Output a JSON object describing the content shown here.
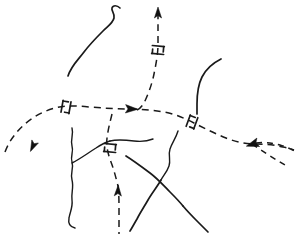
{
  "figure": {
    "background_color": "#ffffff",
    "ink_color": "#1a1a1a",
    "width": 298,
    "height": 249
  },
  "legend_semantics": {
    "dashed_line_meaning": "fault trace (inferred)",
    "solid_line_meaning": "stream / contact line",
    "triangle_arrow_meaning": "relative movement direction",
    "double_tick_meaning": "strike and dip / offset tick pair"
  },
  "features": {
    "solid_curves": [
      {
        "name": "upper-left-wavy-curve",
        "path": "M 68 76 C 71 66 78 60 84 52 C 90 44 96 38 103 31 C 108 26 113 23 114 18 C 115 13 111 11 112 8 C 113 5 117 5 120 8"
      },
      {
        "name": "right-upper-curve",
        "path": "M 221 59 C 213 63 206 69 202 77 C 198 85 197 95 197 104 C 197 110 197 114 197 114"
      },
      {
        "name": "left-vertical-wavy-line",
        "path": "M 72 128 C 74 135 70 140 72 146 C 74 152 70 156 72 162 C 74 168 70 173 72 180 C 74 187 71 193 72 200 C 73 207 70 212 69 218 C 68 223 70 227 75 228"
      },
      {
        "name": "left-branch-to-junction",
        "path": "M 72 163 C 80 159 88 153 96 148 C 102 144 106 142 110 141"
      },
      {
        "name": "mid-right-branch",
        "path": "M 110 141 C 118 139 126 140 134 141 C 142 142 148 141 153 139"
      },
      {
        "name": "lower-left-diagonal",
        "path": "M 126 156 C 134 161 142 167 150 173 C 158 179 164 186 170 192 C 175 197 179 201 183 206"
      },
      {
        "name": "lower-right-long-diagonal",
        "path": "M 183 206 C 188 212 193 217 198 222 C 202 226 205 229 208 232"
      },
      {
        "name": "mid-vertical-wavy-right",
        "path": "M 178 131 C 176 138 172 143 170 149 C 168 155 171 160 169 166 C 167 172 163 176 161 180"
      },
      {
        "name": "crossing-down-left",
        "path": "M 161 180 C 157 187 152 193 148 200 C 144 207 140 213 137 219 C 134 224 132 228 130 231"
      }
    ],
    "dashed_faults": [
      {
        "name": "main-horizontal-fault",
        "path": "M 5 152 C 9 141 16 132 25 124 C 34 116 44 111 55 108 C 66 105 78 106 90 107 C 103 108 115 109 127 109 C 140 109 152 110 164 112 C 176 114 186 119 196 124 C 206 129 216 134 226 138 C 236 142 246 144 256 144 C 266 144 275 145 283 147 C 288 148 291 149 294 150"
      },
      {
        "name": "vertical-fault-upper",
        "path": "M 158 12 C 158 24 158 34 158 44 C 158 54 156 64 154 74 C 152 84 148 95 144 103 C 141 108 138 110 135 111"
      },
      {
        "name": "vertical-fault-lower",
        "path": "M 112 114 C 110 122 108 130 107 138 C 106 146 108 154 111 162 C 114 170 116 178 118 186 C 119 194 119 202 119 210 C 119 218 119 226 119 234"
      },
      {
        "name": "right-branch-fault",
        "path": "M 252 144 C 258 148 264 152 270 156 C 275 159 280 162 285 165"
      },
      {
        "name": "right-tail-fault",
        "path": "M 256 143 C 264 142 272 143 280 145 C 286 147 291 149 295 151"
      }
    ],
    "arrow_markers": [
      {
        "name": "arrow-top-vertical-up",
        "x": 158,
        "y": 13,
        "rotation": 0
      },
      {
        "name": "arrow-left-fault-down",
        "x": 33,
        "y": 146,
        "rotation": 205
      },
      {
        "name": "arrow-center-junction",
        "x": 131,
        "y": 109,
        "rotation": 90
      },
      {
        "name": "arrow-lower-vertical-up",
        "x": 118,
        "y": 191,
        "rotation": 0
      },
      {
        "name": "arrow-right-junction",
        "x": 253,
        "y": 144,
        "rotation": 250
      }
    ],
    "tick_symbols": [
      {
        "name": "tick-left-fault",
        "x": 66,
        "y": 107,
        "rotation": 10
      },
      {
        "name": "tick-upper-vertical-fault",
        "x": 158,
        "y": 50,
        "rotation": 95
      },
      {
        "name": "tick-right-junction",
        "x": 192,
        "y": 122,
        "rotation": 20
      },
      {
        "name": "tick-lower-vertical-fault",
        "x": 110,
        "y": 148,
        "rotation": 95
      }
    ]
  }
}
